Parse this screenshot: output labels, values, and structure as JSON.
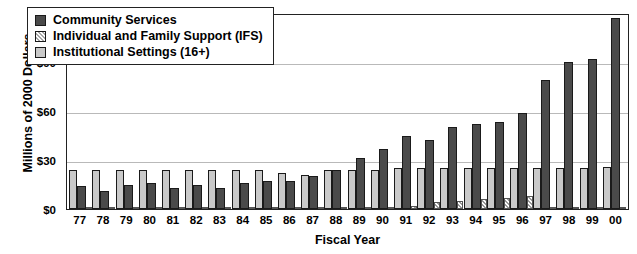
{
  "chart_data": {
    "type": "bar",
    "title": "",
    "xlabel": "Fiscal Year",
    "ylabel": "Millions of 2000 Dollars",
    "ylim": [
      0,
      120
    ],
    "yticks": [
      "$0",
      "$30",
      "$60",
      "$90",
      "$120"
    ],
    "ytick_values": [
      0,
      30,
      60,
      90,
      120
    ],
    "grid": true,
    "legend_position": "top-left",
    "categories": [
      "77",
      "78",
      "79",
      "80",
      "81",
      "82",
      "83",
      "84",
      "85",
      "86",
      "87",
      "88",
      "89",
      "90",
      "91",
      "92",
      "93",
      "94",
      "95",
      "96",
      "97",
      "98",
      "99",
      "00"
    ],
    "series": [
      {
        "name": "Institutional Settings (16+)",
        "color": "#c9c9c9",
        "values": [
          24,
          24,
          24,
          24,
          24,
          24,
          24,
          24,
          24,
          22,
          21,
          24,
          24,
          24,
          25,
          25,
          25,
          25,
          25,
          25,
          25,
          25,
          25,
          26
        ]
      },
      {
        "name": "Community Services",
        "color": "#4a4a4a",
        "values": [
          14,
          11,
          15,
          16,
          13,
          15,
          13,
          16,
          17,
          17,
          20,
          24,
          31,
          37,
          45,
          42,
          50,
          52,
          53,
          59,
          79,
          90,
          92,
          117
        ]
      },
      {
        "name": "Individual and Family Support (IFS)",
        "color": "#a8a8a8",
        "values": [
          1,
          1,
          1,
          1,
          1,
          1,
          1,
          1,
          1,
          1,
          1,
          1,
          1,
          1,
          2,
          4,
          5,
          6,
          7,
          8,
          1,
          1,
          1,
          1
        ]
      }
    ]
  },
  "legend": {
    "items": [
      {
        "label": "Community Services",
        "swatch": "cs"
      },
      {
        "label": "Individual and Family Support (IFS)",
        "swatch": "ifs"
      },
      {
        "label": "Institutional Settings (16+)",
        "swatch": "inst"
      }
    ]
  }
}
